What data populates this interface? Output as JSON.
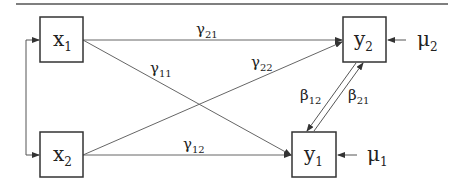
{
  "diagram": {
    "type": "path-diagram",
    "nodes": [
      {
        "id": "x1",
        "base": "x",
        "sub": "1"
      },
      {
        "id": "x2",
        "base": "x",
        "sub": "2"
      },
      {
        "id": "y1",
        "base": "y",
        "sub": "1"
      },
      {
        "id": "y2",
        "base": "y",
        "sub": "2"
      }
    ],
    "errors": [
      {
        "id": "mu2",
        "base": "μ",
        "sub": "2",
        "target": "y2"
      },
      {
        "id": "mu1",
        "base": "μ",
        "sub": "1",
        "target": "y1"
      }
    ],
    "paths": [
      {
        "id": "gamma21",
        "base": "γ",
        "sub": "21",
        "from": "x1",
        "to": "y2"
      },
      {
        "id": "gamma11",
        "base": "γ",
        "sub": "11",
        "from": "x1",
        "to": "y1"
      },
      {
        "id": "gamma22",
        "base": "γ",
        "sub": "22",
        "from": "x2",
        "to": "y2"
      },
      {
        "id": "gamma12",
        "base": "γ",
        "sub": "12",
        "from": "x2",
        "to": "y1"
      },
      {
        "id": "beta12",
        "base": "β",
        "sub": "12",
        "from": "y2",
        "to": "y1"
      },
      {
        "id": "beta21",
        "base": "β",
        "sub": "21",
        "from": "y1",
        "to": "y2"
      }
    ],
    "covariance": {
      "between": [
        "x1",
        "x2"
      ],
      "style": "double-headed"
    }
  }
}
